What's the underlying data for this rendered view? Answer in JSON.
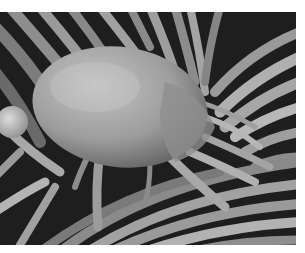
{
  "image": {
    "subject": "dust mite",
    "description": "Grayscale scanning electron micrograph of a dust mite resting on fibers",
    "style": "grayscale SEM"
  }
}
